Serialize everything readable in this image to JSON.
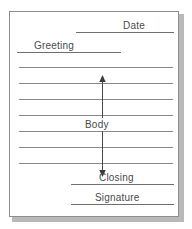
{
  "diagram": {
    "sheet": {
      "background_color": "#ffffff",
      "border_color": "#8c8c8c",
      "shadow_color": "#b9b9b9"
    },
    "line_color": "#6f6f6f",
    "text_color": "#4a4a4a",
    "fields": [
      {
        "id": "date",
        "label": "Date",
        "align": "right",
        "label_x": 122,
        "label_y": 19,
        "line_x": 75,
        "line_y": 31,
        "line_width": 98
      },
      {
        "id": "greeting",
        "label": "Greeting",
        "align": "left",
        "label_x": 33,
        "label_y": 39,
        "line_x": 16,
        "line_y": 51,
        "line_width": 104
      },
      {
        "id": "closing",
        "label": "Closing",
        "align": "right",
        "label_x": 98,
        "label_y": 171,
        "line_x": 70,
        "line_y": 183,
        "line_width": 103
      },
      {
        "id": "signature",
        "label": "Signature",
        "align": "right",
        "label_x": 94,
        "label_y": 191,
        "line_x": 70,
        "line_y": 203,
        "line_width": 103
      }
    ],
    "body": {
      "label": "Body",
      "line_count": 7,
      "line_x": 18,
      "line_width": 154,
      "first_line_y": 66,
      "line_spacing": 16,
      "arrow": {
        "x": 92,
        "top_y": 66,
        "bottom_y": 162,
        "double_headed": true,
        "color": "#4a4a4a"
      }
    }
  }
}
